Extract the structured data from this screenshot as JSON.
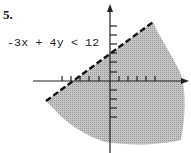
{
  "problem_number": "5.",
  "inequality": "-3x + 4y < 12",
  "graph": {
    "type": "linear-inequality-region",
    "boundary_line": {
      "equation": "-3x + 4y = 12",
      "style": "dashed",
      "slope": 0.75,
      "y_intercept": 3,
      "x_intercept": -4
    },
    "shaded_side": "below",
    "colors": {
      "shade": "#b8b8b8",
      "axis": "#222222",
      "line": "#111111"
    },
    "x_ticks_each_side": 5,
    "y_ticks_each_side": 6
  }
}
